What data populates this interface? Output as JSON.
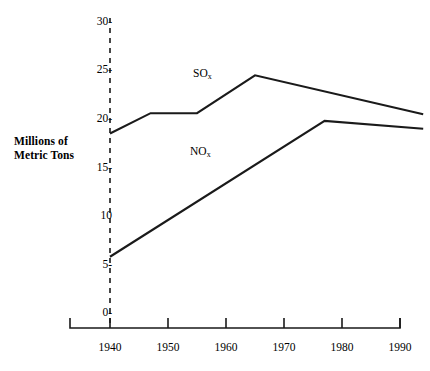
{
  "chart_data": {
    "type": "line",
    "title": "",
    "xlabel": "",
    "ylabel": "Millions of Metric Tons",
    "ylabel_line1": "Millions of",
    "ylabel_line2": "Metric Tons",
    "xlim": [
      1935,
      1994
    ],
    "ylim": [
      0,
      30
    ],
    "grid": false,
    "legend_position": "inline-annotations",
    "xticks": [
      1940,
      1950,
      1960,
      1970,
      1980,
      1990
    ],
    "xtick_labels": [
      "1940",
      "1950",
      "1960",
      "1970",
      "1980",
      "1990"
    ],
    "yticks": [
      0,
      5,
      10,
      15,
      20,
      25,
      30
    ],
    "ytick_labels": [
      "0-",
      "5-",
      "10",
      "15-",
      "20-",
      "25-",
      "30-"
    ],
    "series": [
      {
        "name": "SOx",
        "label_text": "SO",
        "label_sub": "x",
        "x": [
          1940,
          1947,
          1955,
          1965,
          1994
        ],
        "values": [
          18.5,
          20.6,
          20.6,
          24.5,
          20.5
        ]
      },
      {
        "name": "NOx",
        "label_text": "NO",
        "label_sub": "x",
        "x": [
          1940,
          1977,
          1994
        ],
        "values": [
          5.8,
          19.8,
          19.0
        ]
      }
    ],
    "annotations": [
      {
        "text": "SO",
        "sub": "x",
        "x": 1959,
        "y": 23.0
      },
      {
        "text": "NO",
        "sub": "x",
        "x": 1958,
        "y": 16.2
      }
    ],
    "colors": {
      "line": "#1a1a1a",
      "axis": "#1a1a1a",
      "background": "#ffffff"
    }
  }
}
